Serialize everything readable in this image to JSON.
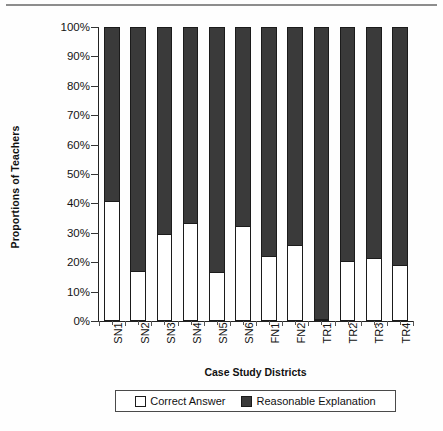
{
  "chart_data": {
    "type": "bar",
    "subtype": "stacked-100-percent",
    "title": "",
    "subtitle": "",
    "xlabel": "Case Study Districts",
    "ylabel": "Proportions of Teachers",
    "ylim": [
      0,
      100
    ],
    "yunit": "%",
    "ytick_labels": [
      "0%",
      "10%",
      "20%",
      "30%",
      "40%",
      "50%",
      "60%",
      "70%",
      "80%",
      "90%",
      "100%"
    ],
    "ytick_values": [
      0,
      10,
      20,
      30,
      40,
      50,
      60,
      70,
      80,
      90,
      100
    ],
    "grid": false,
    "legend_position": "bottom",
    "categories": [
      "SN1",
      "SN2",
      "SN3",
      "SN4",
      "SN5",
      "SN6",
      "FN1",
      "FN2",
      "TR1",
      "TR2",
      "TR3",
      "TR4"
    ],
    "series": [
      {
        "name": "Correct Answer",
        "color": "#ffffff",
        "values": [
          40.5,
          16.5,
          29.0,
          33.0,
          16.0,
          32.0,
          21.5,
          25.5,
          0.0,
          20.0,
          21.0,
          18.5
        ]
      },
      {
        "name": "Reasonable Explanation",
        "color": "#3a3a3a",
        "values": [
          59.5,
          83.5,
          71.0,
          67.0,
          84.0,
          68.0,
          78.5,
          74.5,
          100.0,
          80.0,
          79.0,
          81.5
        ]
      }
    ],
    "annotations": []
  },
  "axes": {
    "y_title": "Proportions of Teachers",
    "x_title": "Case Study Districts"
  },
  "legend": {
    "items": [
      {
        "label": "Correct Answer",
        "swatch": "white-square-swatch"
      },
      {
        "label": "Reasonable Explanation",
        "swatch": "dark-square-swatch"
      }
    ]
  },
  "colors": {
    "correct_answer": "#ffffff",
    "reasonable_explanation": "#3a3a3a",
    "axis": "#222222",
    "text": "#111111",
    "background": "#fefefe"
  }
}
